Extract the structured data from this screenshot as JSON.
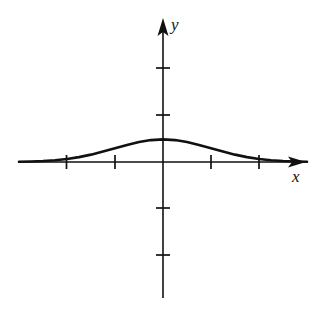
{
  "figure": {
    "title": "",
    "background_color": "#ffffff",
    "ink_color": "#111111",
    "width": 333,
    "height": 315,
    "x_axis_label": "x",
    "y_axis_label": "y"
  },
  "chart_data": {
    "type": "line",
    "title": "",
    "xlabel": "x",
    "ylabel": "y",
    "grid": false,
    "legend": null,
    "axis_style": "arrowed-cartesian-axes",
    "xlim": [
      -3.0,
      3.0
    ],
    "ylim": [
      -3.0,
      3.0
    ],
    "xticks": [
      -2,
      -1,
      1,
      2
    ],
    "yticks": [
      -2,
      -1,
      1,
      2
    ],
    "xtick_labels": [
      "",
      "",
      "",
      ""
    ],
    "ytick_labels": [
      "",
      "",
      "",
      ""
    ],
    "origin_px": [
      163,
      162
    ],
    "unit_px": 48,
    "series": [
      {
        "name": "bell curve",
        "description": "smooth symmetric bell-shaped curve peaking at x = 0, approaching the x-axis asymptotically on both sides",
        "x": [
          -3.0,
          -2.75,
          -2.5,
          -2.25,
          -2.0,
          -1.75,
          -1.5,
          -1.25,
          -1.0,
          -0.75,
          -0.5,
          -0.25,
          0.0,
          0.25,
          0.5,
          0.75,
          1.0,
          1.25,
          1.5,
          1.75,
          2.0,
          2.25,
          2.5,
          2.75,
          3.0
        ],
        "y": [
          0.004,
          0.009,
          0.018,
          0.032,
          0.054,
          0.086,
          0.13,
          0.184,
          0.242,
          0.301,
          0.353,
          0.387,
          0.4,
          0.387,
          0.353,
          0.301,
          0.242,
          0.184,
          0.13,
          0.086,
          0.054,
          0.032,
          0.018,
          0.009,
          0.004
        ],
        "peak_value": 0.4,
        "peak_x": 0.0
      }
    ]
  }
}
